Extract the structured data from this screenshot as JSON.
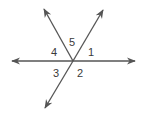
{
  "diagram": {
    "type": "intersecting-lines",
    "colors": {
      "line": "#555555",
      "label": "#3a3a3a",
      "background": "#ffffff"
    },
    "intersection": {
      "x": 73,
      "y": 61
    },
    "rays": [
      {
        "id": "left",
        "tip": {
          "x": 12,
          "y": 61
        }
      },
      {
        "id": "right",
        "tip": {
          "x": 135,
          "y": 61
        }
      },
      {
        "id": "upper-left",
        "tip": {
          "x": 44,
          "y": 9
        }
      },
      {
        "id": "upper-right",
        "tip": {
          "x": 103,
          "y": 10
        }
      },
      {
        "id": "lower-left",
        "tip": {
          "x": 45,
          "y": 108
        }
      }
    ],
    "labels": [
      {
        "text": "5",
        "x": 69,
        "y": 46
      },
      {
        "text": "1",
        "x": 88,
        "y": 56
      },
      {
        "text": "4",
        "x": 51,
        "y": 56
      },
      {
        "text": "3",
        "x": 53,
        "y": 77
      },
      {
        "text": "2",
        "x": 77,
        "y": 77
      }
    ]
  }
}
